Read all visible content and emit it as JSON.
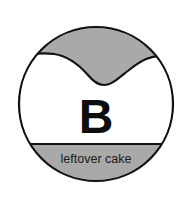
{
  "figure": {
    "background_color": "#ffffff",
    "outline_color": "#111111",
    "fill_gray": "#a9a9a9",
    "fill_white": "#ffffff",
    "letter_label": "B",
    "caption_label": "leftover cake",
    "shape_names": {
      "circle": "outer-circle",
      "top_region": "scalloped-top-region",
      "divider": "horizontal-divider-line",
      "bottom_region": "bottom-segment-region"
    }
  },
  "geometry": {
    "circle_center_x": 96,
    "circle_center_y": 104,
    "circle_radius": 77,
    "divider_y": 144,
    "letter_x": 96,
    "letter_y": 133,
    "caption_x": 96,
    "caption_y": 163
  }
}
